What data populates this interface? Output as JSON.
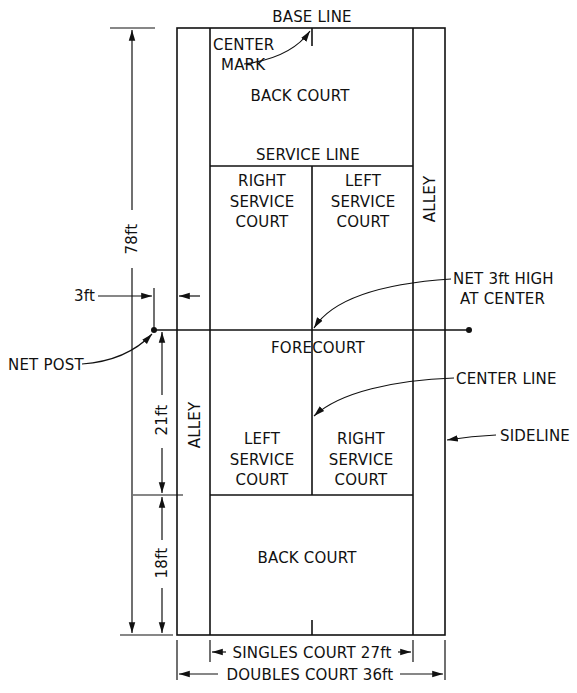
{
  "colors": {
    "line": "#111111",
    "background": "#ffffff"
  },
  "labels": {
    "base_line": "BASE LINE",
    "center_mark_1": "CENTER",
    "center_mark_2": "MARK",
    "back_court_top": "BACK COURT",
    "service_line": "SERVICE LINE",
    "right_service_top_1": "RIGHT",
    "right_service_top_2": "SERVICE",
    "right_service_top_3": "COURT",
    "left_service_top_1": "LEFT",
    "left_service_top_2": "SERVICE",
    "left_service_top_3": "COURT",
    "alley_right": "ALLEY",
    "net_1": "NET 3ft HIGH",
    "net_2": "AT CENTER",
    "three_ft": "3ft",
    "net_post": "NET POST",
    "forecourt": "FORECOURT",
    "center_line": "CENTER LINE",
    "alley_left": "ALLEY",
    "sideline": "SIDELINE",
    "left_service_bottom_1": "LEFT",
    "left_service_bottom_2": "SERVICE",
    "left_service_bottom_3": "COURT",
    "right_service_bottom_1": "RIGHT",
    "right_service_bottom_2": "SERVICE",
    "right_service_bottom_3": "COURT",
    "back_court_bottom": "BACK COURT",
    "dim_78": "78ft",
    "dim_21": "21ft",
    "dim_18": "18ft",
    "singles": "SINGLES COURT 27ft",
    "doubles": "DOUBLES COURT 36ft"
  },
  "dimensions": {
    "court_length_ft": 78,
    "service_box_depth_ft": 21,
    "back_court_depth_ft": 18,
    "singles_width_ft": 27,
    "doubles_width_ft": 36,
    "net_post_offset_ft": 3,
    "net_height_center_ft": 3
  }
}
